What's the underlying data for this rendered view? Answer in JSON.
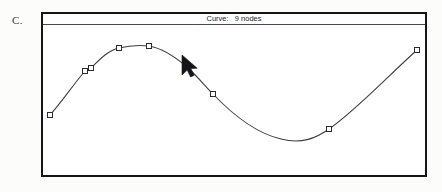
{
  "figure": {
    "label": "C."
  },
  "window": {
    "title_prefix": "Curve:",
    "title_value": "9 nodes",
    "title_full": "Curve:   9 nodes",
    "node_count": 9,
    "frame": {
      "x": 41,
      "y": 12,
      "width": 386,
      "height": 165
    },
    "titlebar_height": 11,
    "border_color": "#16161a",
    "background_color": "#ffffff"
  },
  "canvas": {
    "curve_color": "#3c3c42",
    "node_fill": "#ffffff",
    "node_stroke": "#2a2a30",
    "node_size": 5,
    "view_width": 386,
    "view_height": 154
  },
  "curve": {
    "nodes": [
      {
        "index": 1,
        "x": 7,
        "y": 90,
        "label": "node-1"
      },
      {
        "index": 2,
        "x": 42,
        "y": 46,
        "label": "node-2"
      },
      {
        "index": 3,
        "x": 48,
        "y": 43,
        "label": "node-3"
      },
      {
        "index": 4,
        "x": 76,
        "y": 23,
        "label": "node-4"
      },
      {
        "index": 5,
        "x": 106,
        "y": 21,
        "label": "node-5"
      },
      {
        "index": 6,
        "x": 144,
        "y": 42,
        "label": "node-6"
      },
      {
        "index": 7,
        "x": 170,
        "y": 69,
        "label": "node-7"
      },
      {
        "index": 8,
        "x": 286,
        "y": 104,
        "label": "node-8"
      },
      {
        "index": 9,
        "x": 374,
        "y": 25,
        "label": "node-9"
      }
    ],
    "path": "M 7 90 C 18 78, 30 60, 42 46 L 48 43 C 58 33, 66 25, 76 23 C 88 20, 98 20, 106 21 C 118 23, 130 30, 144 42 C 154 51, 162 61, 170 69 C 190 90, 212 108, 238 114 C 258 119, 272 114, 286 104 C 312 86, 344 52, 374 25"
  },
  "cursor": {
    "name": "mouse-pointer",
    "x": 180,
    "y": 53,
    "color": "#141418",
    "points": "0,0 0,20 5.2,15.1 8.6,22 12.2,20.2 8.8,13.6 15.2,13.2"
  }
}
